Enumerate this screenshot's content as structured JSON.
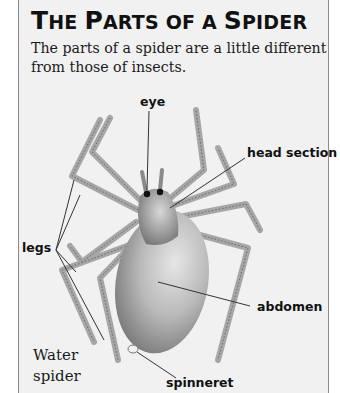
{
  "header": {
    "title_parts": [
      {
        "big": "T",
        "small": "HE "
      },
      {
        "big": "P",
        "small": "ARTS OF A "
      },
      {
        "big": "S",
        "small": "PIDER"
      }
    ],
    "title_full": "The Parts of a Spider",
    "subtitle": "The parts of a spider are a little different from those of insects."
  },
  "diagram": {
    "labels": {
      "eye": "eye",
      "head_section": "head section",
      "legs": "legs",
      "abdomen": "abdomen",
      "spinneret": "spinneret"
    },
    "caption_line1": "Water",
    "caption_line2": "spider"
  },
  "colors": {
    "panel_bg": "#f1f1f1",
    "border": "#8a8a8a",
    "text": "#111111"
  }
}
